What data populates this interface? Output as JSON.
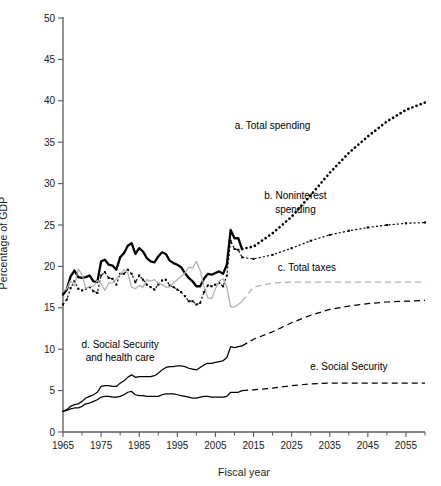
{
  "chart_data": {
    "type": "line",
    "title": "",
    "xlabel": "Fiscal year",
    "ylabel": "Percentage of GDP",
    "xlim": [
      1965,
      2060
    ],
    "ylim": [
      0,
      50
    ],
    "yticks": [
      0,
      5,
      10,
      15,
      20,
      25,
      30,
      35,
      40,
      45,
      50
    ],
    "ytick_labels": [
      "0",
      "5",
      "10",
      "15",
      "20",
      "25",
      "30",
      "35",
      "40",
      "45",
      "50"
    ],
    "xticks": [
      1965,
      1975,
      1985,
      1995,
      2005,
      2015,
      2025,
      2035,
      2045,
      2055
    ],
    "xtick_labels": [
      "1965",
      "1975",
      "1985",
      "1995",
      "2005",
      "2015",
      "2025",
      "2035",
      "2045",
      "2055"
    ],
    "xminor_ticks": [
      1970,
      1980,
      1990,
      2000,
      2010,
      2020,
      2030,
      2040,
      2050,
      2060
    ],
    "grid": false,
    "legend": "inline-annotations",
    "history_projection_split": 2012,
    "annotations": [
      {
        "key": "a",
        "text": "a. Total spending",
        "x": 2020,
        "y": 36.6
      },
      {
        "key": "b",
        "text": "b. Noninterest",
        "x": 2026,
        "y": 28.2
      },
      {
        "key": "b2",
        "text": "spending",
        "x": 2026,
        "y": 26.4
      },
      {
        "key": "c",
        "text": "c. Total taxes",
        "x": 2029,
        "y": 19.4
      },
      {
        "key": "d",
        "text": "d. Social Security",
        "x": 1980,
        "y": 10.1
      },
      {
        "key": "d2",
        "text": "and health care",
        "x": 1980,
        "y": 8.6
      },
      {
        "key": "e",
        "text": "e. Social Security",
        "x": 2040,
        "y": 7.5
      }
    ],
    "series": [
      {
        "name": "a. Total spending",
        "color": "#000000",
        "style_history": "solid-thick",
        "style_projection": "dotted-thick",
        "x": [
          1965,
          1966,
          1967,
          1968,
          1969,
          1970,
          1971,
          1972,
          1973,
          1974,
          1975,
          1976,
          1977,
          1978,
          1979,
          1980,
          1981,
          1982,
          1983,
          1984,
          1985,
          1986,
          1987,
          1988,
          1989,
          1990,
          1991,
          1992,
          1993,
          1994,
          1995,
          1996,
          1997,
          1998,
          1999,
          2000,
          2001,
          2002,
          2003,
          2004,
          2005,
          2006,
          2007,
          2008,
          2009,
          2010,
          2011,
          2012,
          2015,
          2020,
          2025,
          2030,
          2035,
          2040,
          2045,
          2050,
          2055,
          2060
        ],
        "y": [
          16.6,
          17.2,
          18.8,
          19.5,
          18.7,
          18.6,
          18.7,
          18.9,
          18.2,
          18.1,
          20.6,
          20.8,
          20.2,
          20.1,
          19.6,
          21.1,
          21.6,
          22.5,
          22.8,
          21.5,
          22.2,
          21.8,
          21.0,
          20.6,
          20.5,
          21.2,
          21.7,
          21.5,
          20.7,
          20.4,
          20.2,
          19.9,
          19.2,
          18.6,
          18.2,
          17.6,
          17.6,
          18.5,
          19.1,
          19.0,
          19.2,
          19.4,
          19.1,
          20.2,
          24.4,
          23.4,
          23.4,
          22.1,
          22.4,
          24.0,
          26.0,
          28.6,
          31.3,
          33.7,
          35.7,
          37.5,
          38.9,
          39.8
        ]
      },
      {
        "name": "b. Noninterest spending",
        "color": "#000000",
        "style_history": "dotted-marker",
        "style_projection": "dotted-marker",
        "x": [
          1965,
          1966,
          1967,
          1968,
          1969,
          1970,
          1971,
          1972,
          1973,
          1974,
          1975,
          1976,
          1977,
          1978,
          1979,
          1980,
          1981,
          1982,
          1983,
          1984,
          1985,
          1986,
          1987,
          1988,
          1989,
          1990,
          1991,
          1992,
          1993,
          1994,
          1995,
          1996,
          1997,
          1998,
          1999,
          2000,
          2001,
          2002,
          2003,
          2004,
          2005,
          2006,
          2007,
          2008,
          2009,
          2010,
          2011,
          2012,
          2015,
          2020,
          2025,
          2030,
          2035,
          2040,
          2045,
          2050,
          2055,
          2060
        ],
        "y": [
          15.4,
          16.0,
          17.4,
          18.2,
          17.3,
          17.1,
          17.3,
          17.5,
          17.0,
          16.8,
          18.9,
          19.3,
          18.6,
          18.5,
          17.8,
          19.1,
          19.1,
          19.6,
          19.1,
          18.1,
          18.9,
          18.4,
          17.8,
          17.5,
          17.2,
          17.8,
          18.3,
          18.4,
          17.7,
          17.5,
          17.2,
          16.9,
          16.4,
          15.8,
          15.8,
          15.4,
          15.6,
          16.9,
          17.7,
          17.6,
          17.8,
          18.0,
          17.6,
          18.9,
          23.1,
          22.1,
          22.0,
          21.1,
          20.9,
          21.4,
          22.2,
          23.1,
          23.8,
          24.3,
          24.7,
          25.0,
          25.2,
          25.3
        ]
      },
      {
        "name": "c. Total taxes",
        "color": "#b0b0b0",
        "style_history": "solid",
        "style_projection": "dashed",
        "x": [
          1965,
          1966,
          1967,
          1968,
          1969,
          1970,
          1971,
          1972,
          1973,
          1974,
          1975,
          1976,
          1977,
          1978,
          1979,
          1980,
          1981,
          1982,
          1983,
          1984,
          1985,
          1986,
          1987,
          1988,
          1989,
          1990,
          1991,
          1992,
          1993,
          1994,
          1995,
          1996,
          1997,
          1998,
          1999,
          2000,
          2001,
          2002,
          2003,
          2004,
          2005,
          2006,
          2007,
          2008,
          2009,
          2010,
          2011,
          2012,
          2015,
          2020,
          2025,
          2030,
          2035,
          2040,
          2045,
          2050,
          2055,
          2060
        ],
        "y": [
          17.0,
          17.3,
          18.3,
          17.6,
          19.7,
          19.0,
          17.3,
          17.6,
          17.6,
          18.3,
          17.9,
          17.1,
          18.0,
          18.0,
          18.5,
          19.0,
          19.6,
          19.2,
          17.5,
          17.3,
          17.7,
          17.5,
          18.4,
          18.2,
          18.4,
          18.0,
          17.8,
          17.5,
          17.5,
          18.0,
          18.4,
          18.8,
          19.2,
          19.9,
          19.8,
          20.6,
          19.5,
          17.6,
          16.2,
          16.1,
          17.3,
          18.2,
          18.5,
          17.5,
          15.1,
          15.1,
          15.4,
          15.8,
          17.5,
          18.0,
          18.1,
          18.1,
          18.1,
          18.1,
          18.1,
          18.1,
          18.1,
          18.1
        ]
      },
      {
        "name": "d. Social Security and health care",
        "color": "#000000",
        "style_history": "solid",
        "style_projection": "dashed",
        "x": [
          1965,
          1966,
          1967,
          1968,
          1969,
          1970,
          1971,
          1972,
          1973,
          1974,
          1975,
          1976,
          1977,
          1978,
          1979,
          1980,
          1981,
          1982,
          1983,
          1984,
          1985,
          1986,
          1987,
          1988,
          1989,
          1990,
          1991,
          1992,
          1993,
          1994,
          1995,
          1996,
          1997,
          1998,
          1999,
          2000,
          2001,
          2002,
          2003,
          2004,
          2005,
          2006,
          2007,
          2008,
          2009,
          2010,
          2011,
          2012,
          2015,
          2020,
          2025,
          2030,
          2035,
          2040,
          2045,
          2050,
          2055,
          2060
        ],
        "y": [
          2.5,
          2.7,
          3.1,
          3.3,
          3.4,
          3.7,
          4.1,
          4.3,
          4.5,
          4.8,
          5.5,
          5.6,
          5.6,
          5.5,
          5.5,
          5.9,
          6.2,
          6.6,
          6.9,
          6.6,
          6.7,
          6.7,
          6.7,
          6.7,
          6.8,
          7.1,
          7.5,
          7.8,
          7.9,
          7.9,
          8.0,
          8.0,
          7.9,
          7.7,
          7.6,
          7.5,
          7.8,
          8.1,
          8.3,
          8.3,
          8.4,
          8.5,
          8.6,
          9.0,
          10.3,
          10.2,
          10.3,
          10.4,
          11.2,
          12.1,
          13.2,
          14.1,
          14.8,
          15.2,
          15.5,
          15.7,
          15.8,
          15.9
        ]
      },
      {
        "name": "e. Social Security",
        "color": "#000000",
        "style_history": "solid",
        "style_projection": "dashed",
        "x": [
          1965,
          1966,
          1967,
          1968,
          1969,
          1970,
          1971,
          1972,
          1973,
          1974,
          1975,
          1976,
          1977,
          1978,
          1979,
          1980,
          1981,
          1982,
          1983,
          1984,
          1985,
          1986,
          1987,
          1988,
          1989,
          1990,
          1991,
          1992,
          1993,
          1994,
          1995,
          1996,
          1997,
          1998,
          1999,
          2000,
          2001,
          2002,
          2003,
          2004,
          2005,
          2006,
          2007,
          2008,
          2009,
          2010,
          2011,
          2012,
          2015,
          2020,
          2025,
          2030,
          2035,
          2040,
          2045,
          2050,
          2055,
          2060
        ],
        "y": [
          2.5,
          2.6,
          2.8,
          2.9,
          2.9,
          3.1,
          3.4,
          3.5,
          3.7,
          3.9,
          4.2,
          4.3,
          4.3,
          4.2,
          4.2,
          4.3,
          4.5,
          4.8,
          4.9,
          4.5,
          4.4,
          4.4,
          4.3,
          4.3,
          4.3,
          4.3,
          4.5,
          4.6,
          4.6,
          4.6,
          4.5,
          4.4,
          4.3,
          4.2,
          4.1,
          4.1,
          4.2,
          4.3,
          4.3,
          4.2,
          4.2,
          4.2,
          4.2,
          4.3,
          4.8,
          4.8,
          4.8,
          5.0,
          5.1,
          5.3,
          5.6,
          5.8,
          5.9,
          5.9,
          5.9,
          5.9,
          5.9,
          5.9
        ]
      }
    ]
  },
  "axis": {
    "ylabel_text": "Percentage of GDP",
    "xlabel_text": "Fiscal year"
  }
}
